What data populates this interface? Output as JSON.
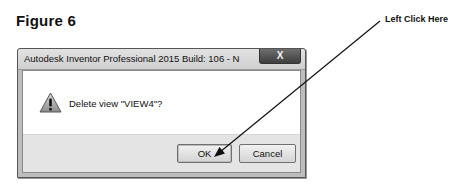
{
  "figure": {
    "title": "Figure 6"
  },
  "annotation": {
    "label": "Left Click Here",
    "target": "ok-button"
  },
  "dialog": {
    "title": "Autodesk Inventor Professional 2015 Build: 106 - NOT FOR RESA...",
    "close_label": "X",
    "icon": "warning-icon",
    "message": "Delete view \"VIEW4\"?",
    "buttons": {
      "ok_label": "OK",
      "cancel_label": "Cancel"
    }
  }
}
